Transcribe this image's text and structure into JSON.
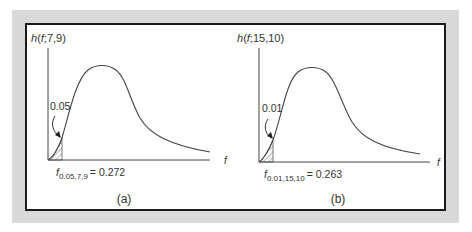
{
  "panels": [
    {
      "id": "a",
      "y_label": "h(f;7,9)",
      "y_label_parts": {
        "fn": "h",
        "open": "(",
        "var": "f",
        "rest": ";7,9)"
      },
      "x_label": "f",
      "area_label": "0.05",
      "critical_label_base": "f",
      "critical_label_sub": "0.05,7,9",
      "critical_label_value": "= 0.272",
      "caption": "(a)"
    },
    {
      "id": "b",
      "y_label": "h(f;15,10)",
      "y_label_parts": {
        "fn": "h",
        "open": "(",
        "var": "f",
        "rest": ";15,10)"
      },
      "x_label": "f",
      "area_label": "0.01",
      "critical_label_base": "f",
      "critical_label_sub": "0.01,15,10",
      "critical_label_value": "= 0.263",
      "caption": "(b)"
    }
  ],
  "colors": {
    "frame": "#d9d9d9",
    "border": "#1a1a1a",
    "ink": "#333333"
  }
}
